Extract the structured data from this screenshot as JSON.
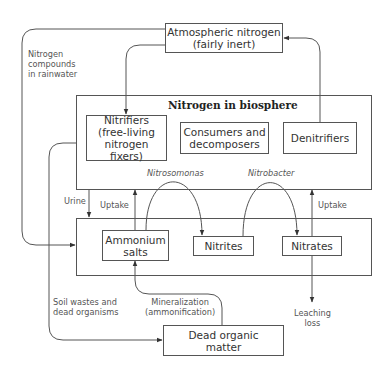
{
  "diagram": {
    "nodes": {
      "atmospheric": {
        "line1": "Atmospheric nitrogen",
        "line2": "(fairly inert)"
      },
      "biosphere": {
        "title": "Nitrogen in biosphere"
      },
      "nitrifiers": {
        "line1": "Nitrifiers",
        "line2": "(free-living",
        "line3": "nitrogen fixers)"
      },
      "consumers": {
        "line1": "Consumers and",
        "line2": "decomposers"
      },
      "denitrifiers": {
        "line1": "Denitrifiers"
      },
      "ammonium": {
        "line1": "Ammonium",
        "line2": "salts"
      },
      "nitrites": {
        "line1": "Nitrites"
      },
      "nitrates": {
        "line1": "Nitrates"
      },
      "dead_matter": {
        "line1": "Dead organic",
        "line2": "matter"
      }
    },
    "edge_labels": {
      "rainwater": {
        "line1": "Nitrogen",
        "line2": "compounds",
        "line3": "in rainwater"
      },
      "urine": "Urine",
      "uptake_left": "Uptake",
      "uptake_right": "Uptake",
      "nitrosomonas": "Nitrosomonas",
      "nitrobacter": "Nitrobacter",
      "soil_wastes": {
        "line1": "Soil wastes and",
        "line2": "dead organisms"
      },
      "mineralization": {
        "line1": "Mineralization",
        "line2": "(ammonification)"
      },
      "leaching": {
        "line1": "Leaching",
        "line2": "loss"
      }
    },
    "colors": {
      "line": "#444444",
      "text": "#333333"
    }
  }
}
